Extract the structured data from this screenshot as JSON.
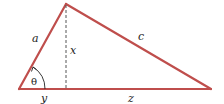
{
  "diagram": {
    "type": "triangle",
    "colors": {
      "edges": "#bf4e4c",
      "altitude": "#555555",
      "text": "#222222",
      "background": "#ffffff"
    },
    "vertices": {
      "left": [
        19,
        89
      ],
      "top": [
        66,
        4
      ],
      "right": [
        211,
        89
      ]
    },
    "labels": {
      "a": "a",
      "c": "c",
      "x": "x",
      "y": "y",
      "z": "z",
      "theta": "θ"
    }
  }
}
